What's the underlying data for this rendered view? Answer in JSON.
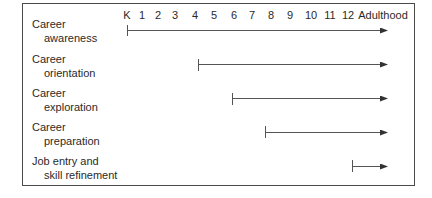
{
  "timeline": {
    "ticks": [
      "K",
      "1",
      "2",
      "3",
      "4",
      "5",
      "6",
      "7",
      "8",
      "9",
      "10",
      "11",
      "12",
      "Adulthood"
    ]
  },
  "rows": [
    {
      "line1": "Career",
      "line2": "awareness",
      "starts_at": "K"
    },
    {
      "line1": "Career",
      "line2": "orientation",
      "starts_at": "4"
    },
    {
      "line1": "Career",
      "line2": "exploration",
      "starts_at": "6"
    },
    {
      "line1": "Career",
      "line2": "preparation",
      "starts_at": "8"
    },
    {
      "line1": "Job entry and",
      "line2": "skill refinement",
      "starts_at": "12"
    }
  ],
  "colors": {
    "line": "#555555",
    "border": "#4a4a4a",
    "text": "#2a2a2a"
  }
}
